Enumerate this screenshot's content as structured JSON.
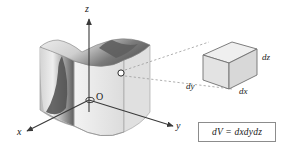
{
  "figure": {
    "kind": "3d-volume-element-diagram",
    "background_color": "#ffffff"
  },
  "axes": {
    "z_label": "z",
    "y_label": "y",
    "x_label": "x",
    "origin_label": "O",
    "line_color": "#3a3a3a"
  },
  "solid": {
    "description": "curved three-dimensional region",
    "fill_light": "#e8e8e8",
    "fill_mid": "#c9c9c9",
    "fill_dark": "#6e6e6e",
    "outline_color": "#808080"
  },
  "point": {
    "marker": "open-circle",
    "color": "#333333"
  },
  "callout": {
    "line_style": "dashed",
    "color": "#9a9a9a"
  },
  "cube": {
    "label_dz": "dz",
    "label_dx": "dx",
    "label_dy": "dy",
    "fill_top": "#efefef",
    "fill_left": "#e3e3e3",
    "fill_right": "#d8d8d8",
    "outline_color": "#6f6f6f"
  },
  "formula": {
    "text": "dV = dxdydz",
    "border_color": "#8c8c8c"
  }
}
